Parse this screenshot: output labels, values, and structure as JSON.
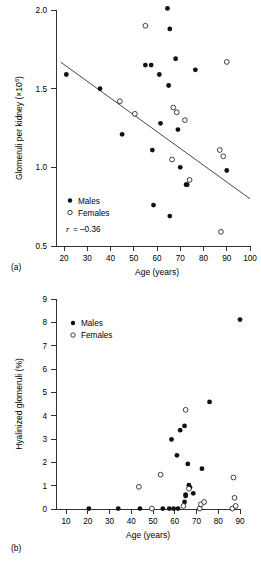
{
  "figure": {
    "panels": [
      {
        "tag": "(a)",
        "name": "glomeruli-per-kidney-vs-age"
      },
      {
        "tag": "(b)",
        "name": "hyalinized-glomeruli-vs-age"
      }
    ]
  },
  "chart_data": [
    {
      "type": "scatter",
      "panel": "(a)",
      "title": "",
      "xlabel": "Age (years)",
      "ylabel": "Glomeruli per kidney (×10⁶)",
      "ylabel_base": "Glomeruli per kidney (×10",
      "ylabel_exp": "6",
      "ylabel_tail": ")",
      "xlim": [
        20,
        100
      ],
      "ylim": [
        0.5,
        2.0
      ],
      "xticks": [
        20,
        30,
        40,
        50,
        60,
        70,
        80,
        90,
        100
      ],
      "yticks": [
        0.5,
        1.0,
        1.5,
        2.0
      ],
      "ytick_labels": [
        "0.5",
        "1.0",
        "1.5",
        "2.0"
      ],
      "grid": false,
      "legend_position": "lower-left",
      "annotation": "r = –0.36",
      "annotation_symbol": "r",
      "annotation_value": "= –0.36",
      "correlation_r": -0.36,
      "trendline": {
        "label": "regression-line",
        "x": [
          22,
          100
        ],
        "y": [
          1.68,
          1.0
        ]
      },
      "series": [
        {
          "name": "Males",
          "marker": "filled-circle",
          "color": "#111111",
          "points": [
            [
              21,
              1.59
            ],
            [
              35.5,
              1.5
            ],
            [
              45,
              1.21
            ],
            [
              55,
              1.65
            ],
            [
              57.5,
              1.65
            ],
            [
              58,
              1.11
            ],
            [
              58.5,
              0.76
            ],
            [
              61,
              1.59
            ],
            [
              61.5,
              1.28
            ],
            [
              64.5,
              2.01
            ],
            [
              65,
              1.52
            ],
            [
              65.5,
              1.88
            ],
            [
              65.5,
              0.69
            ],
            [
              68,
              1.69
            ],
            [
              69,
              1.24
            ],
            [
              70,
              1.0
            ],
            [
              72.5,
              0.89
            ],
            [
              73,
              0.89
            ],
            [
              76.5,
              1.62
            ],
            [
              90,
              0.98
            ]
          ]
        },
        {
          "name": "Females",
          "marker": "open-circle",
          "color": "#ffffff",
          "points": [
            [
              44,
              1.42
            ],
            [
              50.5,
              1.34
            ],
            [
              55,
              1.9
            ],
            [
              66.5,
              1.05
            ],
            [
              67,
              1.38
            ],
            [
              68.5,
              1.35
            ],
            [
              72,
              1.3
            ],
            [
              74,
              0.92
            ],
            [
              87,
              1.11
            ],
            [
              87.5,
              0.59
            ],
            [
              88.5,
              1.07
            ],
            [
              90,
              1.67
            ]
          ]
        }
      ]
    },
    {
      "type": "scatter",
      "panel": "(b)",
      "title": "",
      "xlabel": "Age (years)",
      "ylabel": "Hyalinized glomeruli (%)",
      "xlim": [
        10,
        90
      ],
      "ylim": [
        0,
        9
      ],
      "xticks": [
        10,
        20,
        30,
        40,
        50,
        60,
        70,
        80,
        90
      ],
      "yticks": [
        0,
        1,
        2,
        3,
        4,
        5,
        6,
        7,
        8,
        9
      ],
      "grid": false,
      "legend_position": "upper-left",
      "series": [
        {
          "name": "Males",
          "marker": "filled-circle",
          "color": "#111111",
          "points": [
            [
              20.5,
              0.02
            ],
            [
              34,
              0.02
            ],
            [
              44,
              0.02
            ],
            [
              54.5,
              0.02
            ],
            [
              57.5,
              0.02
            ],
            [
              59.5,
              0.02
            ],
            [
              61.5,
              0.02
            ],
            [
              61.0,
              2.3
            ],
            [
              58.5,
              2.98
            ],
            [
              62.5,
              3.38
            ],
            [
              64.5,
              3.56
            ],
            [
              64.5,
              0.3
            ],
            [
              65,
              0.56
            ],
            [
              65,
              0.62
            ],
            [
              66,
              1.93
            ],
            [
              66.5,
              1.02
            ],
            [
              67,
              0.92
            ],
            [
              68.5,
              0.67
            ],
            [
              72.5,
              1.73
            ],
            [
              76,
              4.59
            ],
            [
              90,
              8.12
            ]
          ]
        },
        {
          "name": "Females",
          "marker": "open-circle",
          "color": "#ffffff",
          "points": [
            [
              43.5,
              0.95
            ],
            [
              49.5,
              0.02
            ],
            [
              53.5,
              1.47
            ],
            [
              64,
              0.13
            ],
            [
              65,
              4.25
            ],
            [
              66.5,
              0.87
            ],
            [
              71.5,
              0.02
            ],
            [
              72,
              0.2
            ],
            [
              73.5,
              0.3
            ],
            [
              86.5,
              0.02
            ],
            [
              87,
              1.35
            ],
            [
              87.5,
              0.48
            ],
            [
              88,
              0.13
            ]
          ]
        }
      ]
    }
  ],
  "legends": {
    "a": {
      "males": "Males",
      "females": "Females"
    },
    "b": {
      "males": "Males",
      "females": "Females"
    }
  }
}
